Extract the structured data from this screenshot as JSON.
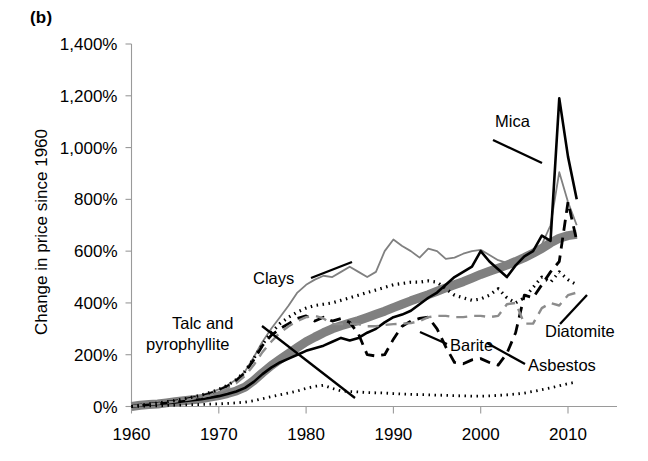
{
  "panel": {
    "label": "(b)"
  },
  "axes": {
    "ylabel": "Change in price since 1960",
    "xlabel": "",
    "yticks": [
      "0%",
      "200%",
      "400%",
      "600%",
      "800%",
      "1,000%",
      "1,200%",
      "1,400%"
    ],
    "xticks": [
      "1960",
      "1970",
      "1980",
      "1990",
      "2000",
      "2010"
    ]
  },
  "annotations": {
    "clays": "Clays",
    "talc": "Talc and",
    "talc2": "pyrophyllite",
    "barite": "Barite",
    "asbestos": "Asbestos",
    "diatomite": "Diatomite",
    "mica": "Mica"
  },
  "colors": {
    "talc": "#808080",
    "clays": "#808080",
    "mica": "#000000",
    "asbestos": "#000000",
    "barite": "#8c8c8c",
    "diatomite": "#000000",
    "axis": "#9a9a9a"
  },
  "chart_data": {
    "type": "line",
    "title": "",
    "subtitle": "",
    "xlabel": "",
    "ylabel": "Change in price since 1960",
    "xlim": [
      1960,
      2012
    ],
    "ylim": [
      0,
      1400
    ],
    "grid": false,
    "legend": "annotations-inline",
    "yunit": "%",
    "ytick_values": [
      0,
      200,
      400,
      600,
      800,
      1000,
      1200,
      1400
    ],
    "xtick_values": [
      1960,
      1970,
      1980,
      1990,
      2000,
      2010
    ],
    "x": [
      1960,
      1961,
      1962,
      1963,
      1964,
      1965,
      1966,
      1967,
      1968,
      1969,
      1970,
      1971,
      1972,
      1973,
      1974,
      1975,
      1976,
      1977,
      1978,
      1979,
      1980,
      1981,
      1982,
      1983,
      1984,
      1985,
      1986,
      1987,
      1988,
      1989,
      1990,
      1991,
      1992,
      1993,
      1994,
      1995,
      1996,
      1997,
      1998,
      1999,
      2000,
      2001,
      2002,
      2003,
      2004,
      2005,
      2006,
      2007,
      2008,
      2009,
      2010,
      2011
    ],
    "series": [
      {
        "name": "Talc and pyrophyllite",
        "style": "thick-solid",
        "color": "#808080",
        "linewidth": 9,
        "values": [
          0,
          5,
          8,
          10,
          14,
          18,
          22,
          26,
          30,
          36,
          42,
          50,
          60,
          75,
          100,
          130,
          158,
          182,
          205,
          228,
          250,
          268,
          285,
          300,
          312,
          322,
          332,
          344,
          356,
          368,
          382,
          395,
          408,
          420,
          432,
          445,
          458,
          470,
          482,
          496,
          510,
          522,
          534,
          546,
          560,
          575,
          592,
          610,
          632,
          650,
          660,
          665
        ]
      },
      {
        "name": "Clays",
        "style": "thin-solid",
        "color": "#808080",
        "linewidth": 1.8,
        "values": [
          0,
          6,
          10,
          14,
          18,
          24,
          30,
          36,
          44,
          54,
          66,
          82,
          104,
          135,
          190,
          250,
          300,
          345,
          390,
          440,
          470,
          490,
          505,
          500,
          520,
          540,
          520,
          500,
          520,
          600,
          645,
          620,
          600,
          575,
          610,
          600,
          570,
          575,
          590,
          600,
          605,
          585,
          565,
          555,
          560,
          575,
          600,
          625,
          700,
          905,
          790,
          700
        ]
      },
      {
        "name": "Mica",
        "style": "solid",
        "color": "#000000",
        "linewidth": 2.6,
        "values": [
          0,
          4,
          7,
          10,
          13,
          16,
          20,
          24,
          28,
          34,
          40,
          48,
          58,
          72,
          95,
          125,
          150,
          170,
          185,
          200,
          215,
          225,
          235,
          250,
          265,
          255,
          265,
          285,
          300,
          325,
          345,
          355,
          370,
          395,
          420,
          440,
          470,
          500,
          520,
          540,
          600,
          560,
          530,
          500,
          545,
          580,
          600,
          660,
          640,
          1190,
          965,
          800
        ]
      },
      {
        "name": "Asbestos",
        "style": "dashed",
        "color": "#000000",
        "linewidth": 2.8,
        "values": [
          0,
          5,
          9,
          12,
          16,
          21,
          27,
          33,
          40,
          50,
          62,
          78,
          100,
          130,
          180,
          235,
          275,
          300,
          320,
          340,
          350,
          330,
          345,
          330,
          340,
          325,
          280,
          200,
          195,
          200,
          260,
          310,
          330,
          340,
          345,
          300,
          230,
          170,
          165,
          180,
          185,
          170,
          160,
          205,
          285,
          430,
          420,
          470,
          520,
          560,
          790,
          640
        ]
      },
      {
        "name": "Barite",
        "style": "dashed",
        "color": "#8c8c8c",
        "linewidth": 2.4,
        "values": [
          0,
          5,
          8,
          11,
          15,
          19,
          24,
          30,
          36,
          44,
          55,
          70,
          90,
          118,
          160,
          210,
          250,
          285,
          310,
          330,
          345,
          350,
          340,
          318,
          318,
          320,
          318,
          310,
          310,
          315,
          318,
          320,
          322,
          330,
          345,
          350,
          350,
          345,
          345,
          350,
          350,
          345,
          350,
          395,
          400,
          320,
          320,
          380,
          400,
          390,
          430,
          440
        ]
      },
      {
        "name": "Diatomite",
        "style": "dotted",
        "color": "#000000",
        "linewidth": 3.2,
        "values": [
          0,
          5,
          9,
          13,
          18,
          23,
          29,
          36,
          44,
          54,
          66,
          82,
          104,
          136,
          185,
          240,
          285,
          320,
          345,
          365,
          380,
          390,
          395,
          400,
          410,
          420,
          430,
          440,
          450,
          460,
          470,
          475,
          480,
          480,
          485,
          480,
          455,
          430,
          420,
          410,
          415,
          430,
          455,
          420,
          400,
          420,
          460,
          500,
          480,
          520,
          490,
          470
        ]
      },
      {
        "name": "Lower dotted series",
        "style": "dotted",
        "color": "#000000",
        "linewidth": 2.8,
        "values": [
          0,
          1,
          2,
          3,
          4,
          5,
          6,
          7,
          8,
          9,
          10,
          12,
          14,
          17,
          22,
          30,
          38,
          45,
          52,
          60,
          70,
          78,
          82,
          70,
          60,
          58,
          56,
          54,
          53,
          52,
          50,
          48,
          47,
          46,
          45,
          44,
          43,
          42,
          41,
          40,
          40,
          41,
          43,
          45,
          48,
          52,
          58,
          65,
          72,
          80,
          88,
          95
        ]
      }
    ]
  }
}
